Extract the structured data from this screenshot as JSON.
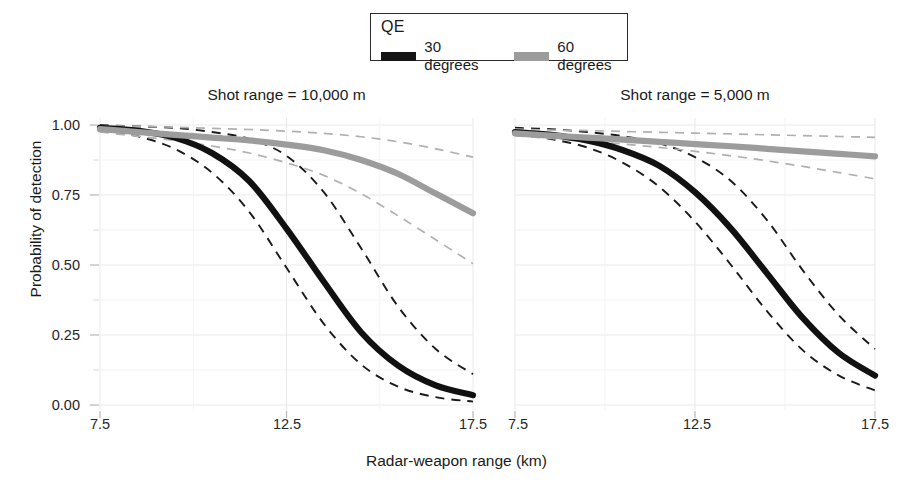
{
  "figure": {
    "width": 913,
    "height": 493,
    "background": "#ffffff"
  },
  "legend": {
    "title": "QE",
    "entries": [
      {
        "label": "30 degrees",
        "color": "#141414",
        "swatch": "thick-line-swatch"
      },
      {
        "label": "60 degrees",
        "color": "#9c9c9c",
        "swatch": "thick-line-swatch"
      }
    ]
  },
  "axes": {
    "x_title": "Radar-weapon range (km)",
    "y_title": "Probability of detection",
    "x_ticks": [
      "7.5",
      "12.5",
      "17.5"
    ],
    "y_ticks": [
      "0.00",
      "0.25",
      "0.50",
      "0.75",
      "1.00"
    ],
    "xlim": [
      7.5,
      17.5
    ],
    "ylim": [
      0.0,
      1.0
    ],
    "x_minor_ticks": [
      "10.0",
      "15.0"
    ],
    "y_minor_ticks": [
      "0.125",
      "0.375",
      "0.625",
      "0.875"
    ],
    "grid": true
  },
  "panels": [
    {
      "title": "Shot range = 10,000 m"
    },
    {
      "title": "Shot range = 5,000 m"
    }
  ],
  "colors": {
    "series_30": "#141414",
    "series_60": "#9c9c9c",
    "gridline": "#e9e9e9",
    "gridline_minor": "#f3f3f3",
    "text": "#1a1a1a"
  },
  "chart_data": {
    "type": "line",
    "title": "",
    "xlabel": "Radar-weapon range (km)",
    "ylabel": "Probability of detection",
    "xlim": [
      7.5,
      17.5
    ],
    "ylim": [
      0.0,
      1.0
    ],
    "grid": true,
    "legend_title": "QE",
    "legend_position": "top-center",
    "facets": [
      {
        "facet_label": "Shot range = 10,000 m",
        "x": [
          7.5,
          8.5,
          9.5,
          10.5,
          11.5,
          12.5,
          13.5,
          14.5,
          15.5,
          16.5,
          17.5
        ],
        "series": [
          {
            "name": "30 degrees",
            "color": "#141414",
            "style": "solid",
            "values": [
              0.99,
              0.98,
              0.955,
              0.9,
              0.8,
              0.63,
              0.44,
              0.26,
              0.14,
              0.07,
              0.035
            ]
          },
          {
            "name": "30 degrees upper CI",
            "color": "#1a1a1a",
            "style": "dashed",
            "values": [
              1.0,
              0.995,
              0.99,
              0.975,
              0.95,
              0.89,
              0.76,
              0.56,
              0.35,
              0.2,
              0.11
            ]
          },
          {
            "name": "30 degrees lower CI",
            "color": "#1a1a1a",
            "style": "dashed",
            "values": [
              0.985,
              0.96,
              0.915,
              0.83,
              0.69,
              0.49,
              0.29,
              0.145,
              0.065,
              0.028,
              0.012
            ]
          },
          {
            "name": "60 degrees",
            "color": "#9c9c9c",
            "style": "solid",
            "values": [
              0.985,
              0.975,
              0.965,
              0.955,
              0.945,
              0.93,
              0.91,
              0.875,
              0.825,
              0.755,
              0.685
            ]
          },
          {
            "name": "60 degrees upper CI",
            "color": "#b0b0b0",
            "style": "dashed",
            "values": [
              0.998,
              0.995,
              0.992,
              0.988,
              0.984,
              0.978,
              0.97,
              0.958,
              0.94,
              0.915,
              0.885
            ]
          },
          {
            "name": "60 degrees lower CI",
            "color": "#b0b0b0",
            "style": "dashed",
            "values": [
              0.975,
              0.96,
              0.945,
              0.925,
              0.9,
              0.865,
              0.82,
              0.755,
              0.675,
              0.59,
              0.505
            ]
          }
        ]
      },
      {
        "facet_label": "Shot range = 5,000 m",
        "x": [
          7.5,
          8.5,
          9.5,
          10.5,
          11.5,
          12.5,
          13.5,
          14.5,
          15.5,
          16.5,
          17.5
        ],
        "series": [
          {
            "name": "30 degrees",
            "color": "#141414",
            "style": "solid",
            "values": [
              0.975,
              0.965,
              0.945,
              0.91,
              0.855,
              0.76,
              0.63,
              0.47,
              0.31,
              0.185,
              0.105
            ]
          },
          {
            "name": "30 degrees upper CI",
            "color": "#1a1a1a",
            "style": "dashed",
            "values": [
              0.99,
              0.985,
              0.975,
              0.96,
              0.935,
              0.885,
              0.8,
              0.66,
              0.48,
              0.32,
              0.2
            ]
          },
          {
            "name": "30 degrees lower CI",
            "color": "#1a1a1a",
            "style": "dashed",
            "values": [
              0.97,
              0.95,
              0.92,
              0.865,
              0.78,
              0.655,
              0.5,
              0.335,
              0.195,
              0.105,
              0.052
            ]
          },
          {
            "name": "60 degrees",
            "color": "#9c9c9c",
            "style": "solid",
            "values": [
              0.97,
              0.962,
              0.955,
              0.948,
              0.94,
              0.932,
              0.924,
              0.915,
              0.906,
              0.897,
              0.888
            ]
          },
          {
            "name": "60 degrees upper CI",
            "color": "#b0b0b0",
            "style": "dashed",
            "values": [
              0.985,
              0.982,
              0.98,
              0.977,
              0.974,
              0.971,
              0.968,
              0.965,
              0.962,
              0.959,
              0.956
            ]
          },
          {
            "name": "60 degrees lower CI",
            "color": "#b0b0b0",
            "style": "dashed",
            "values": [
              0.962,
              0.952,
              0.942,
              0.932,
              0.92,
              0.906,
              0.89,
              0.872,
              0.852,
              0.83,
              0.808
            ]
          }
        ]
      }
    ]
  }
}
